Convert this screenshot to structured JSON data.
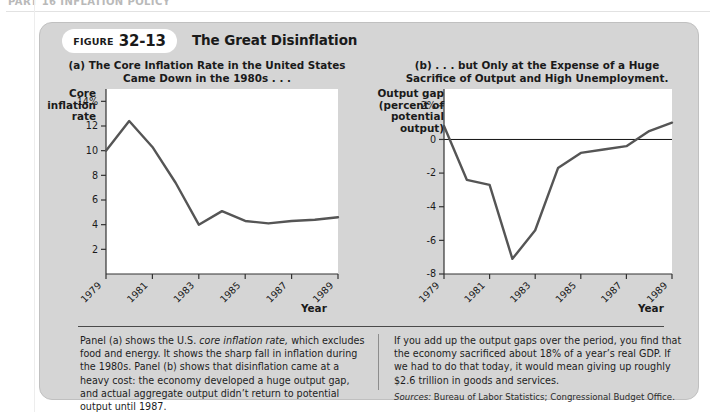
{
  "page": {
    "running_header": "PART 16   INFLATION POLICY",
    "background_color": "#ffffff"
  },
  "figure": {
    "badge_label": "FIGURE",
    "badge_number": "32-13",
    "title": "The Great Disinflation",
    "panel_color": "#d5d5d5",
    "plot_color": "#ffffff",
    "line_color": "#555555"
  },
  "chart_data": [
    {
      "type": "line",
      "panel": "a",
      "title": "(a) The Core Inflation Rate in the United States Came Down in the 1980s . . .",
      "title_line1": "(a) The Core Inflation Rate in the United States",
      "title_line2": "Came Down in the 1980s . . .",
      "ylabel": "Core inflation rate",
      "ylabel_lines": [
        "Core",
        "inflation",
        "rate"
      ],
      "xlabel": "Year",
      "x": [
        1979,
        1980,
        1981,
        1982,
        1983,
        1984,
        1985,
        1986,
        1987,
        1988,
        1989
      ],
      "values": [
        10.0,
        12.4,
        10.3,
        7.4,
        4.0,
        5.1,
        4.3,
        4.1,
        4.3,
        4.4,
        4.6
      ],
      "series": [
        {
          "name": "Core inflation rate",
          "values": [
            10.0,
            12.4,
            10.3,
            7.4,
            4.0,
            5.1,
            4.3,
            4.1,
            4.3,
            4.4,
            4.6
          ]
        }
      ],
      "ytick_labels": [
        "14%",
        "12",
        "10",
        "8",
        "6",
        "4",
        "2"
      ],
      "ytick_values": [
        14,
        12,
        10,
        8,
        6,
        4,
        2
      ],
      "xtick_labels": [
        "1979",
        "1981",
        "1983",
        "1985",
        "1987",
        "1989"
      ],
      "xtick_values": [
        1979,
        1981,
        1983,
        1985,
        1987,
        1989
      ],
      "ylim": [
        0,
        15
      ],
      "xlim": [
        1979,
        1989
      ],
      "grid": false,
      "legend": "none",
      "zero_line": false
    },
    {
      "type": "line",
      "panel": "b",
      "title": "(b) . . . but Only at the Expense of a Huge Sacrifice of Output and High Unemployment.",
      "title_line1": "(b) . . . but Only at the Expense of a Huge",
      "title_line2": "Sacrifice of Output and High Unemployment.",
      "ylabel": "Output gap (percent of potential output)",
      "ylabel_lines": [
        "Output gap",
        "(percent of",
        "potential",
        "output)"
      ],
      "xlabel": "Year",
      "x": [
        1979,
        1980,
        1981,
        1982,
        1983,
        1984,
        1985,
        1986,
        1987,
        1988,
        1989
      ],
      "values": [
        0.8,
        -2.4,
        -2.7,
        -7.1,
        -5.4,
        -1.7,
        -0.8,
        -0.6,
        -0.4,
        0.5,
        1.0
      ],
      "series": [
        {
          "name": "Output gap",
          "values": [
            0.8,
            -2.4,
            -2.7,
            -7.1,
            -5.4,
            -1.7,
            -0.8,
            -0.6,
            -0.4,
            0.5,
            1.0
          ]
        }
      ],
      "ytick_labels": [
        "2%",
        "0",
        "-2",
        "-4",
        "-6",
        "-8"
      ],
      "ytick_values": [
        2,
        0,
        -2,
        -4,
        -6,
        -8
      ],
      "xtick_labels": [
        "1979",
        "1981",
        "1983",
        "1985",
        "1987",
        "1989"
      ],
      "xtick_values": [
        1979,
        1981,
        1983,
        1985,
        1987,
        1989
      ],
      "ylim": [
        -8,
        3
      ],
      "xlim": [
        1979,
        1989
      ],
      "grid": false,
      "legend": "none",
      "zero_line": true
    }
  ],
  "caption": {
    "left_part1": "Panel (a) shows the U.S. ",
    "left_italic": "core inflation rate,",
    "left_part2": " which excludes food and energy. It shows the sharp fall in inflation during the 1980s. Panel (b) shows that disinflation came at a heavy cost: the economy developed a huge output gap, and actual aggregate output didn’t return to potential output until 1987.",
    "right_text": "If you add up the output gaps over the period, you find that the economy sacrificed about 18% of a year’s real GDP. If we had to do that today, it would mean giving up roughly $2.6 trillion in goods and services.",
    "sources_label": "Sources:",
    "sources_text": " Bureau of Labor Statistics; Congressional Budget Office."
  }
}
